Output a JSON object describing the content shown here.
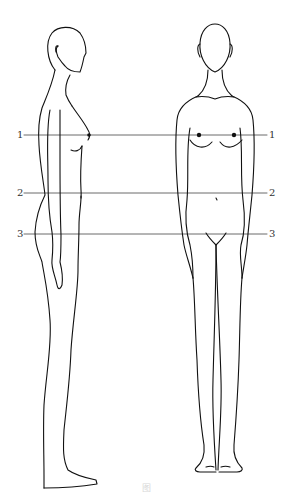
{
  "figure": {
    "views": [
      {
        "name": "side-view"
      },
      {
        "name": "front-view"
      }
    ],
    "reference_lines": [
      {
        "id": "1",
        "left_label": "1",
        "right_label": "1",
        "landmark": "bust"
      },
      {
        "id": "2",
        "left_label": "2",
        "right_label": "2",
        "landmark": "waist"
      },
      {
        "id": "3",
        "left_label": "3",
        "right_label": "3",
        "landmark": "hip"
      }
    ],
    "caption": "图"
  }
}
